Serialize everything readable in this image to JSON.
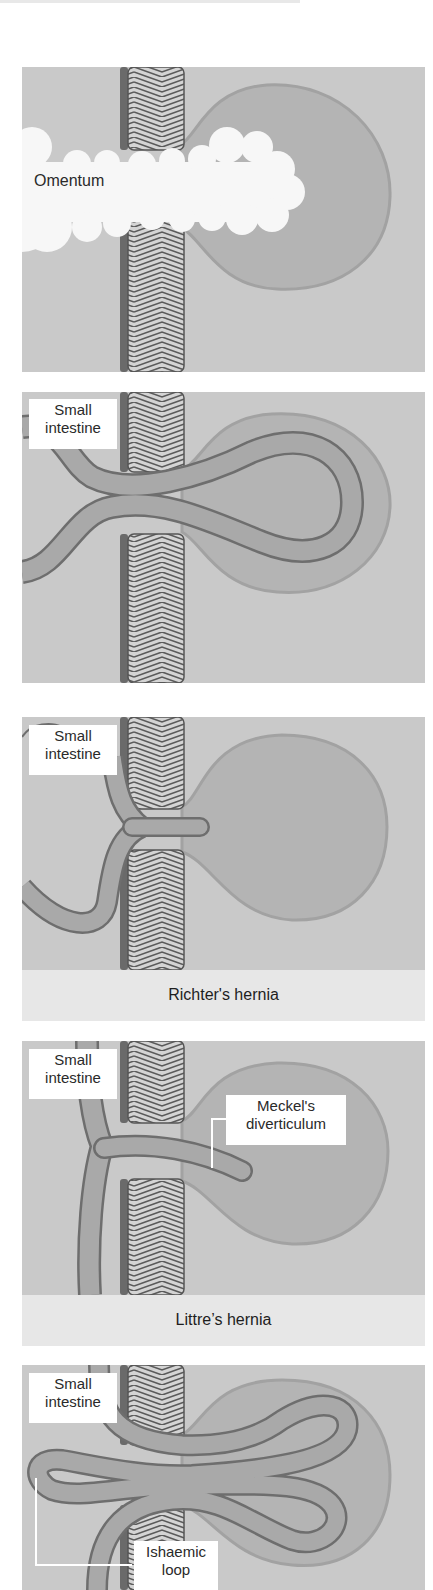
{
  "figure": {
    "panels": [
      {
        "id": "omentum",
        "labels": [
          {
            "text": "Omentum"
          }
        ]
      },
      {
        "id": "small-intestine-loop",
        "labels": [
          {
            "line1": "Small",
            "line2": "intestine"
          }
        ]
      },
      {
        "id": "richter",
        "labels": [
          {
            "line1": "Small",
            "line2": "intestine"
          }
        ],
        "caption": "Richter's hernia"
      },
      {
        "id": "littre",
        "labels": [
          {
            "line1": "Small",
            "line2": "intestine"
          },
          {
            "line1": "Meckel's",
            "line2": "diverticulum"
          }
        ],
        "caption": "Littre’s hernia"
      },
      {
        "id": "maydl",
        "labels": [
          {
            "line1": "Small",
            "line2": "intestine"
          },
          {
            "line1": "Ishaemic",
            "line2": "loop"
          }
        ]
      }
    ],
    "colors": {
      "background": "#c9c9c9",
      "sac": "#b4b4b4",
      "sac_edge": "#a2a2a2",
      "bowel": "#a9a9a9",
      "bowel_edge": "#6e6e6e",
      "wall_hatch_light": "#d6d6d6",
      "wall_hatch_dark": "#5a5a5a",
      "wall_shadow": "#6a6a6a",
      "omentum": "#f7f7f7",
      "caption_band": "#e7e7e7"
    }
  }
}
